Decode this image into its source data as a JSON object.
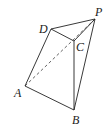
{
  "diagram": {
    "vertices": [
      {
        "id": "P",
        "label": "P",
        "x": 95,
        "y": 19,
        "lx": 95,
        "ly": 16
      },
      {
        "id": "D",
        "label": "D",
        "x": 51,
        "y": 29,
        "lx": 39,
        "ly": 33
      },
      {
        "id": "C",
        "label": "C",
        "x": 74,
        "y": 41,
        "lx": 76,
        "ly": 51
      },
      {
        "id": "A",
        "label": "A",
        "x": 25,
        "y": 86,
        "lx": 14,
        "ly": 97
      },
      {
        "id": "B",
        "label": "B",
        "x": 74,
        "y": 110,
        "lx": 72,
        "ly": 124
      }
    ],
    "edges": [
      {
        "from": "A",
        "to": "D",
        "style": "solid"
      },
      {
        "from": "D",
        "to": "P",
        "style": "solid"
      },
      {
        "from": "D",
        "to": "C",
        "style": "solid"
      },
      {
        "from": "C",
        "to": "P",
        "style": "solid"
      },
      {
        "from": "C",
        "to": "B",
        "style": "solid"
      },
      {
        "from": "A",
        "to": "B",
        "style": "solid"
      },
      {
        "from": "B",
        "to": "P",
        "style": "solid"
      },
      {
        "from": "A",
        "to": "P",
        "style": "dashed"
      }
    ],
    "stroke_color": "#222222",
    "background": "#ffffff"
  }
}
